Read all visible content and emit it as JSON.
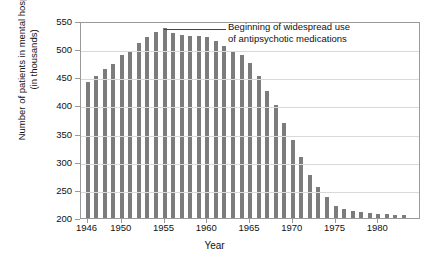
{
  "chart_data": {
    "type": "bar",
    "title": "",
    "xlabel": "Year",
    "ylabel": "Number of patients in mental hospitals (in thousands)",
    "ylabel_line1": "Number of patients in mental hospitals",
    "ylabel_line2": "(in thousands)",
    "ylim": [
      200,
      550
    ],
    "ytick_labels": [
      "200",
      "250",
      "300",
      "350",
      "400",
      "450",
      "500",
      "550"
    ],
    "ytick_values": [
      200,
      250,
      300,
      350,
      400,
      450,
      500,
      550
    ],
    "xtick_labels": [
      "1946",
      "1950",
      "1955",
      "1960",
      "1965",
      "1970",
      "1975",
      "1980"
    ],
    "xtick_values": [
      1946,
      1950,
      1955,
      1960,
      1965,
      1970,
      1975,
      1980
    ],
    "grid": "horizontal",
    "legend": "none",
    "bar_color": "#7c7c7c",
    "categories": [
      1946,
      1947,
      1948,
      1949,
      1950,
      1951,
      1952,
      1953,
      1954,
      1955,
      1956,
      1957,
      1958,
      1959,
      1960,
      1961,
      1962,
      1963,
      1964,
      1965,
      1966,
      1967,
      1968,
      1969,
      1970,
      1971,
      1972,
      1973,
      1974,
      1975,
      1976,
      1977,
      1978,
      1979,
      1980,
      1981,
      1982,
      1983
    ],
    "values": [
      441,
      453,
      464,
      474,
      489,
      496,
      511,
      522,
      530,
      537,
      528,
      525,
      524,
      523,
      521,
      515,
      505,
      496,
      490,
      475,
      452,
      426,
      400,
      369,
      339,
      308,
      276,
      255,
      237,
      222,
      216,
      213,
      210,
      209,
      208,
      207,
      206,
      205
    ],
    "annotations": [
      {
        "text": "Beginning of widespread use of antipsychotic medications",
        "line1": "Beginning of widespread use",
        "line2": "of antipsychotic medications",
        "points_at_year": 1955
      }
    ]
  }
}
